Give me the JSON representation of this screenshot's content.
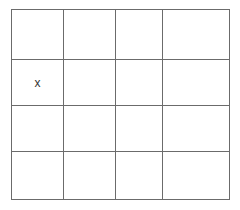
{
  "board": {
    "rows": 4,
    "cols": 4,
    "col_edges": [
      0,
      52,
      104,
      151,
      218
    ],
    "row_edges": [
      0,
      50,
      96,
      142,
      190
    ],
    "line_color": "#6b6b6b",
    "cells": [
      [
        "",
        "",
        "",
        ""
      ],
      [
        "x",
        "",
        "",
        ""
      ],
      [
        "",
        "",
        "",
        ""
      ],
      [
        "",
        "",
        "",
        ""
      ]
    ]
  }
}
